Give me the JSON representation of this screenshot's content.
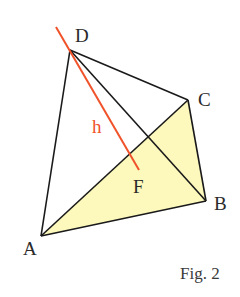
{
  "figure": {
    "caption": "Fig. 2"
  },
  "colors": {
    "edge": "#1a1a1a",
    "height_line": "#f0522a",
    "base_fill": "#fdf9bc",
    "background": "#ffffff"
  },
  "vertices": {
    "A": {
      "label": "A",
      "x": 41,
      "y": 236
    },
    "B": {
      "label": "B",
      "x": 206,
      "y": 201
    },
    "C": {
      "label": "C",
      "x": 188,
      "y": 100
    },
    "D": {
      "label": "D",
      "x": 70,
      "y": 50
    },
    "F": {
      "label": "F",
      "x": 139,
      "y": 170
    }
  },
  "edges": [
    "DA",
    "DB",
    "DC",
    "AB",
    "BC",
    "AC"
  ],
  "height": {
    "label": "h",
    "from": [
      56,
      27
    ],
    "to": [
      139,
      170
    ]
  },
  "labels": {
    "A": "A",
    "B": "B",
    "C": "C",
    "D": "D",
    "F": "F",
    "h": "h"
  }
}
